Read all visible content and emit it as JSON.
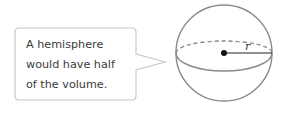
{
  "callout": {
    "lines": [
      "A hemisphere",
      "would have half",
      "of the volume."
    ],
    "border_color": "#c8c8c8"
  },
  "sphere": {
    "radius_label": "r",
    "stroke_color": "#8a8a8a",
    "equator_style": "front solid, back dashed",
    "center_dot": true
  }
}
